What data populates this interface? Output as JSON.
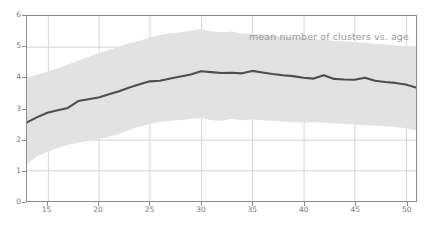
{
  "chart_data": {
    "type": "line",
    "title": "",
    "annotation": "mean number of clusters vs. age",
    "xlabel": "",
    "ylabel": "",
    "xlim": [
      13,
      51
    ],
    "ylim": [
      0,
      6
    ],
    "grid": true,
    "legend_position": "none",
    "xticks": [
      15,
      20,
      25,
      30,
      35,
      40,
      45,
      50
    ],
    "yticks": [
      0,
      1,
      2,
      3,
      4,
      5,
      6
    ],
    "xtick_labels": [
      "15",
      "20",
      "25",
      "30",
      "35",
      "40",
      "45",
      "50"
    ],
    "ytick_labels": [
      "0",
      "1",
      "2",
      "3",
      "4",
      "5",
      "6"
    ],
    "colors": {
      "line": "#4d4d4d",
      "band": "#e2e2e2",
      "grid": "#d4d4d4",
      "axis": "#8d8d8d",
      "tick_text": "#7a7a7a",
      "annotation_text": "#9a9a9a",
      "background": "#ffffff"
    },
    "x": [
      13,
      14,
      15,
      16,
      17,
      18,
      19,
      20,
      21,
      22,
      23,
      24,
      25,
      26,
      27,
      28,
      29,
      30,
      31,
      32,
      33,
      34,
      35,
      36,
      37,
      38,
      39,
      40,
      41,
      42,
      43,
      44,
      45,
      46,
      47,
      48,
      49,
      50,
      51
    ],
    "series": [
      {
        "name": "mean number of clusters",
        "values": [
          2.55,
          2.72,
          2.86,
          2.94,
          3.02,
          3.24,
          3.3,
          3.36,
          3.46,
          3.56,
          3.68,
          3.79,
          3.88,
          3.9,
          3.97,
          4.04,
          4.1,
          4.21,
          4.18,
          4.15,
          4.16,
          4.14,
          4.22,
          4.17,
          4.12,
          4.08,
          4.05,
          4.0,
          3.97,
          4.08,
          3.96,
          3.94,
          3.93,
          4.0,
          3.9,
          3.86,
          3.83,
          3.78,
          3.68
        ]
      },
      {
        "name": "upper band",
        "values": [
          4.0,
          4.1,
          4.2,
          4.3,
          4.43,
          4.55,
          4.67,
          4.79,
          4.9,
          5.0,
          5.12,
          5.2,
          5.3,
          5.38,
          5.43,
          5.47,
          5.52,
          5.57,
          5.5,
          5.47,
          5.5,
          5.43,
          5.42,
          5.4,
          5.37,
          5.33,
          5.3,
          5.28,
          5.25,
          5.23,
          5.2,
          5.18,
          5.15,
          5.13,
          5.1,
          5.08,
          5.05,
          5.03,
          5.0
        ]
      },
      {
        "name": "lower band",
        "values": [
          1.2,
          1.45,
          1.6,
          1.72,
          1.82,
          1.9,
          1.95,
          2.0,
          2.08,
          2.18,
          2.3,
          2.42,
          2.5,
          2.56,
          2.6,
          2.63,
          2.66,
          2.7,
          2.62,
          2.6,
          2.66,
          2.62,
          2.64,
          2.62,
          2.6,
          2.58,
          2.56,
          2.54,
          2.56,
          2.54,
          2.52,
          2.5,
          2.48,
          2.46,
          2.44,
          2.42,
          2.4,
          2.36,
          2.3
        ]
      }
    ]
  }
}
